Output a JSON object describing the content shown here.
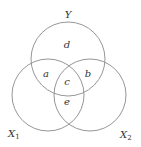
{
  "diagram": {
    "type": "venn-3",
    "sets": [
      {
        "id": "Y",
        "label": "Y",
        "subscript": ""
      },
      {
        "id": "X1",
        "label": "X",
        "subscript": "1"
      },
      {
        "id": "X2",
        "label": "X",
        "subscript": "2"
      }
    ],
    "regions": [
      {
        "id": "d",
        "label": "d",
        "membership": [
          "Y"
        ]
      },
      {
        "id": "a",
        "label": "a",
        "membership": [
          "Y",
          "X1"
        ]
      },
      {
        "id": "b",
        "label": "b",
        "membership": [
          "Y",
          "X2"
        ]
      },
      {
        "id": "c",
        "label": "c",
        "membership": [
          "Y",
          "X1",
          "X2"
        ]
      },
      {
        "id": "e",
        "label": "e",
        "membership": [
          "X1",
          "X2"
        ]
      }
    ],
    "stroke_color": "#8a8a8a",
    "text_color": "#333333"
  }
}
